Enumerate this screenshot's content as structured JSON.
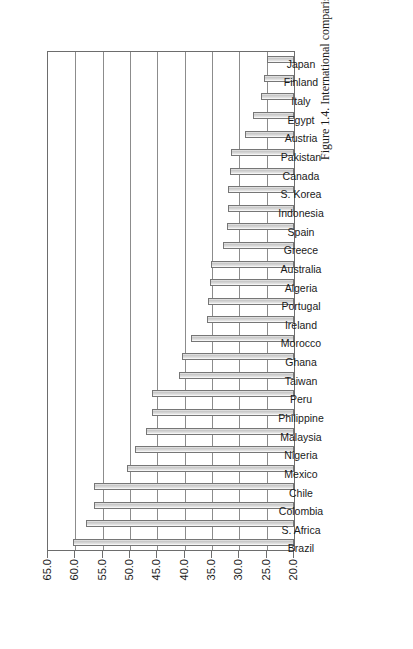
{
  "figure": {
    "caption": "Figure 1.4. International comparison of Gini coefficients, 1990s"
  },
  "chart_data": {
    "type": "bar",
    "title": "Figure 1.4. International comparison of Gini coefficients, 1990s",
    "xlabel": "",
    "ylabel": "",
    "ylim": [
      20.0,
      65.0
    ],
    "ytick_step": 5.0,
    "grid": true,
    "legend": "none",
    "orientation": "vertical bars, chart rotated 90 degrees on page; category labels rotated",
    "bar_fill_color": "#d8d8d8",
    "bar_border_color": "#767676",
    "ticks": [
      "20.0",
      "25.0",
      "30.0",
      "35.0",
      "40.0",
      "45.0",
      "50.0",
      "55.0",
      "60.0",
      "65.0"
    ],
    "categories": [
      "Brazil",
      "S. Africa",
      "Colombia",
      "Chile",
      "Mexico",
      "Nigeria",
      "Malaysia",
      "Philippine",
      "Peru",
      "Taiwan",
      "Ghana",
      "Morocco",
      "Ireland",
      "Portugal",
      "Algeria",
      "Australia",
      "Greece",
      "Spain",
      "Indonesia",
      "S. Korea",
      "Canada",
      "Pakistan",
      "Austria",
      "Egypt",
      "Italy",
      "Finland",
      "Japan"
    ],
    "values": [
      60.5,
      58.0,
      56.5,
      56.5,
      50.5,
      49.0,
      47.0,
      46.0,
      46.0,
      41.0,
      40.5,
      38.8,
      36.0,
      35.8,
      35.3,
      35.2,
      33.0,
      32.2,
      32.0,
      32.0,
      31.8,
      31.5,
      29.0,
      27.5,
      26.0,
      25.5,
      25.0
    ]
  }
}
